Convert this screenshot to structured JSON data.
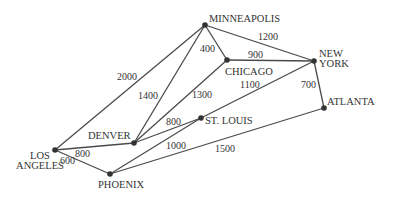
{
  "diagram": {
    "type": "weighted-undirected-graph",
    "nodes": [
      {
        "id": "minneapolis",
        "label": "MINNEAPOLIS",
        "x": 205,
        "y": 25,
        "lx": 209,
        "ly": 22,
        "anchor": "start",
        "lines": [
          "MINNEAPOLIS"
        ]
      },
      {
        "id": "chicago",
        "label": "CHICAGO",
        "x": 227,
        "y": 60,
        "lx": 225,
        "ly": 75,
        "anchor": "start",
        "lines": [
          "CHICAGO"
        ]
      },
      {
        "id": "new-york",
        "label": "NEW YORK",
        "x": 314,
        "y": 61,
        "lx": 319,
        "ly": 57,
        "anchor": "start",
        "lines": [
          "NEW",
          "YORK"
        ]
      },
      {
        "id": "atlanta",
        "label": "ATLANTA",
        "x": 324,
        "y": 108,
        "lx": 327,
        "ly": 105,
        "anchor": "start",
        "lines": [
          "ATLANTA"
        ]
      },
      {
        "id": "st-louis",
        "label": "ST. LOUIS",
        "x": 201,
        "y": 118,
        "lx": 205,
        "ly": 124,
        "anchor": "start",
        "lines": [
          "ST. LOUIS"
        ]
      },
      {
        "id": "denver",
        "label": "DENVER",
        "x": 134,
        "y": 143,
        "lx": 88,
        "ly": 139,
        "anchor": "start",
        "lines": [
          "DENVER"
        ]
      },
      {
        "id": "los-angeles",
        "label": "LOS ANGELES",
        "x": 55,
        "y": 150,
        "lx": 40,
        "ly": 159,
        "anchor": "middle",
        "lines": [
          "LOS",
          "ANGELES"
        ]
      },
      {
        "id": "phoenix",
        "label": "PHOENIX",
        "x": 110,
        "y": 174,
        "lx": 98,
        "ly": 188,
        "anchor": "start",
        "lines": [
          "PHOENIX"
        ]
      }
    ],
    "edges": [
      {
        "from": "los-angeles",
        "to": "minneapolis",
        "weight": "2000",
        "wx": 117,
        "wy": 80
      },
      {
        "from": "denver",
        "to": "minneapolis",
        "weight": "1400",
        "wx": 138,
        "wy": 99
      },
      {
        "from": "minneapolis",
        "to": "chicago",
        "weight": "400",
        "wx": 200,
        "wy": 52
      },
      {
        "from": "minneapolis",
        "to": "new-york",
        "weight": "1200",
        "wx": 258,
        "wy": 40
      },
      {
        "from": "chicago",
        "to": "new-york",
        "weight": "900",
        "wx": 248,
        "wy": 58
      },
      {
        "from": "denver",
        "to": "chicago",
        "weight": "1300",
        "wx": 192,
        "wy": 98
      },
      {
        "from": "st-louis",
        "to": "new-york",
        "weight": "1100",
        "wx": 240,
        "wy": 88
      },
      {
        "from": "new-york",
        "to": "atlanta",
        "weight": "700",
        "wx": 301,
        "wy": 88
      },
      {
        "from": "denver",
        "to": "st-louis",
        "weight": "800",
        "wx": 166,
        "wy": 125
      },
      {
        "from": "los-angeles",
        "to": "denver",
        "weight": "800",
        "wx": 75,
        "wy": 157
      },
      {
        "from": "los-angeles",
        "to": "phoenix",
        "weight": "600",
        "wx": 60,
        "wy": 164
      },
      {
        "from": "phoenix",
        "to": "st-louis",
        "weight": "1000",
        "wx": 166,
        "wy": 149
      },
      {
        "from": "phoenix",
        "to": "atlanta",
        "weight": "1500",
        "wx": 215,
        "wy": 152
      }
    ]
  }
}
